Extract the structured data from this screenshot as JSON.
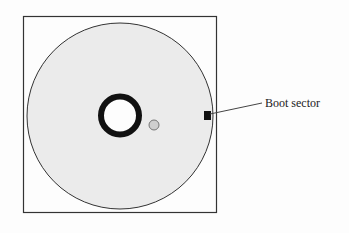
{
  "diagram": {
    "labels": {
      "boot_sector": "Boot sector"
    },
    "colors": {
      "background": "#fdfdfd",
      "disk_fill": "#ebebeb",
      "stroke": "#222222",
      "hole_fill": "#cfcfcf"
    }
  }
}
